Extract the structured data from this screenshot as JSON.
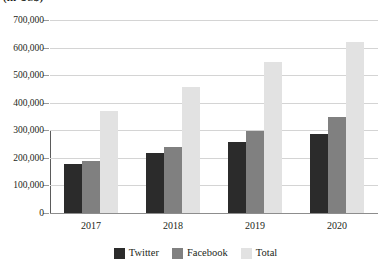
{
  "chart_data": {
    "type": "bar",
    "title": "",
    "axis_unit_caption": "(in US$)",
    "categories": [
      "2017",
      "2018",
      "2019",
      "2020"
    ],
    "series": [
      {
        "name": "Twitter",
        "color": "#2b2b2b",
        "values": [
          178000,
          218000,
          258000,
          285000
        ]
      },
      {
        "name": "Facebook",
        "color": "#808080",
        "values": [
          190000,
          240000,
          297000,
          347000
        ]
      },
      {
        "name": "Total",
        "color": "#e2e2e2",
        "values": [
          370000,
          458000,
          548000,
          622000
        ]
      }
    ],
    "xlabel": "",
    "ylabel": "",
    "ylim": [
      0,
      700000
    ],
    "ytick_values": [
      0,
      100000,
      200000,
      300000,
      400000,
      500000,
      600000,
      700000
    ],
    "ytick_labels": [
      "0",
      "100,000",
      "200,000",
      "300,000",
      "400,000",
      "500,000",
      "600,000",
      "700,000"
    ],
    "grid": true,
    "legend_position": "bottom"
  }
}
